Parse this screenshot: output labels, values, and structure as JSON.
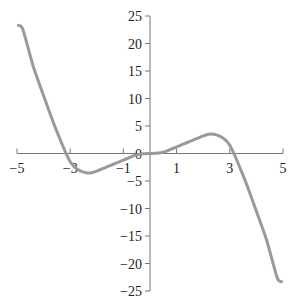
{
  "chart_data": {
    "type": "line",
    "title": "",
    "xlabel": "",
    "ylabel": "",
    "xlim": [
      -5,
      5
    ],
    "ylim": [
      -25,
      25
    ],
    "grid": false,
    "legend": null,
    "x_ticks": [
      -5,
      -3,
      -1,
      1,
      3,
      5
    ],
    "x_tick_labels": [
      "−5",
      "−3",
      "−1",
      "1",
      "3",
      "5"
    ],
    "y_ticks": [
      25,
      20,
      15,
      10,
      5,
      0,
      -5,
      -10,
      -15,
      -20,
      -25
    ],
    "y_tick_labels": [
      "25",
      "20",
      "15",
      "10",
      "5",
      "0",
      "−5",
      "−10",
      "−15",
      "−20",
      "−25"
    ],
    "series": [
      {
        "name": "f(x)",
        "color": "#9a9a9a",
        "x": [
          -4.95,
          -4.8,
          -4.6,
          -4.4,
          -4.2,
          -4.0,
          -3.8,
          -3.6,
          -3.4,
          -3.2,
          -3.0,
          -2.8,
          -2.6,
          -2.4,
          -2.2,
          -2.0,
          -1.8,
          -1.6,
          -1.4,
          -1.2,
          -1.0,
          -0.8,
          -0.6,
          -0.4,
          -0.2,
          0.0,
          0.2,
          0.4,
          0.6,
          0.8,
          1.0,
          1.2,
          1.4,
          1.6,
          1.8,
          2.0,
          2.2,
          2.4,
          2.6,
          2.8,
          3.0,
          3.2,
          3.4,
          3.6,
          3.8,
          4.0,
          4.2,
          4.4,
          4.6,
          4.8,
          4.95
        ],
        "y": [
          23.3,
          22.8,
          19.5,
          16.0,
          13.2,
          10.5,
          7.8,
          5.2,
          2.8,
          0.5,
          -1.5,
          -2.6,
          -3.2,
          -3.5,
          -3.5,
          -3.2,
          -2.8,
          -2.4,
          -2.0,
          -1.6,
          -1.2,
          -0.8,
          -0.4,
          -0.15,
          -0.05,
          0.0,
          0.05,
          0.15,
          0.4,
          0.8,
          1.2,
          1.6,
          2.0,
          2.4,
          2.8,
          3.2,
          3.5,
          3.5,
          3.2,
          2.6,
          1.5,
          -0.5,
          -2.8,
          -5.2,
          -7.8,
          -10.5,
          -13.2,
          -16.0,
          -19.5,
          -22.8,
          -23.3
        ]
      }
    ]
  }
}
